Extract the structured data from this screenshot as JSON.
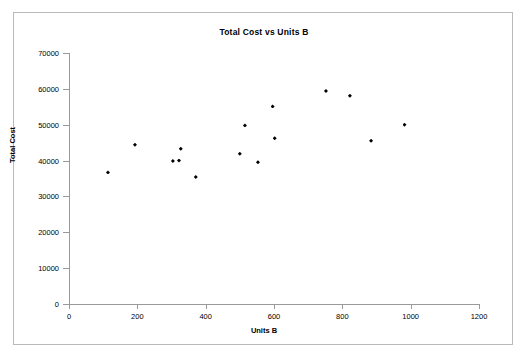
{
  "chart_data": {
    "type": "scatter",
    "title": "Total Cost vs Units B",
    "xlabel": "Units B",
    "ylabel": "Total Cost",
    "xlim": [
      0,
      1200
    ],
    "ylim": [
      0,
      70000
    ],
    "xticks": [
      0,
      200,
      400,
      600,
      800,
      1000,
      1200
    ],
    "yticks": [
      0,
      10000,
      20000,
      30000,
      40000,
      50000,
      60000,
      70000
    ],
    "xtick_labels": [
      "0",
      "200",
      "400",
      "600",
      "800",
      "1000",
      "1200"
    ],
    "ytick_labels": [
      "0",
      "10000",
      "20000",
      "30000",
      "40000",
      "50000",
      "60000",
      "70000"
    ],
    "grid": false,
    "legend": false,
    "marker": "diamond",
    "marker_color": "#000000",
    "series": [
      {
        "name": "Total Cost",
        "points": [
          {
            "x": 114,
            "y": 36700
          },
          {
            "x": 193,
            "y": 44400
          },
          {
            "x": 304,
            "y": 39900
          },
          {
            "x": 322,
            "y": 40000
          },
          {
            "x": 327,
            "y": 43300
          },
          {
            "x": 371,
            "y": 35400
          },
          {
            "x": 500,
            "y": 41900
          },
          {
            "x": 515,
            "y": 49800
          },
          {
            "x": 553,
            "y": 39500
          },
          {
            "x": 596,
            "y": 55100
          },
          {
            "x": 602,
            "y": 46200
          },
          {
            "x": 752,
            "y": 59400
          },
          {
            "x": 822,
            "y": 58100
          },
          {
            "x": 884,
            "y": 45500
          },
          {
            "x": 982,
            "y": 50000
          }
        ]
      }
    ]
  }
}
